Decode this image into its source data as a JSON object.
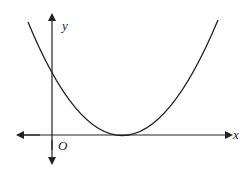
{
  "diagram": {
    "type": "parabola-graph",
    "labels": {
      "x_axis": "x",
      "y_axis": "y",
      "origin": "O"
    },
    "colors": {
      "stroke": "#222222",
      "background": "#ffffff"
    },
    "curve": {
      "shape": "upward parabola",
      "vertex_position": "on positive x-axis (tangent to x-axis)",
      "y_intercept": "positive"
    }
  }
}
